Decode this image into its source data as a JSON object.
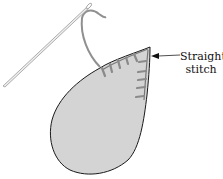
{
  "diagram": {
    "callout": {
      "line1": "Straight",
      "line2": "stitch"
    },
    "elements": [
      "needle",
      "thread",
      "leaf-appliqué",
      "stitches",
      "arrow"
    ],
    "colors": {
      "leaf_fill": "#d4d4d4",
      "outline": "#1a1a1a",
      "stitch": "#8a8a8a",
      "thread": "#909090",
      "needle": "#9a9a9a"
    }
  }
}
